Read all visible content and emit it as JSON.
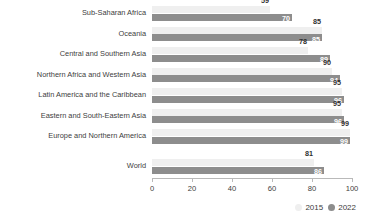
{
  "chart_data": {
    "type": "bar",
    "orientation": "horizontal",
    "title": "",
    "subtitle": "",
    "xlabel": "",
    "ylabel": "",
    "xlim": [
      0,
      100
    ],
    "xticks": [
      0,
      20,
      40,
      60,
      80,
      100
    ],
    "grid": false,
    "legend_position": "bottom-right",
    "categories": [
      "Sub-Saharan Africa",
      "Oceania",
      "Central and Southern Asia",
      "Northern Africa and Western Asia",
      "Latin America and the Caribbean",
      "Eastern and South-Eastern Asia",
      "Europe and Northern America",
      "World"
    ],
    "series": [
      {
        "name": "2015",
        "color": "#efefef",
        "values": [
          59,
          85,
          78,
          90,
          95,
          95,
          99,
          81
        ]
      },
      {
        "name": "2022",
        "color": "#8d8d8d",
        "values": [
          70,
          85,
          89,
          94,
          96,
          96,
          99,
          86
        ]
      }
    ]
  },
  "legend": {
    "items": [
      {
        "label": "2015",
        "marker": "legend-dot-2015"
      },
      {
        "label": "2022",
        "marker": "legend-dot-2022"
      }
    ]
  },
  "colors": {
    "series_2015": "#efefef",
    "series_2022": "#8d8d8d",
    "axis": "#b9b9b9",
    "text": "#3d3d3d",
    "value_label_light": "#ffffff",
    "value_label_dark": "#2f2f2f",
    "background": "#ffffff"
  }
}
